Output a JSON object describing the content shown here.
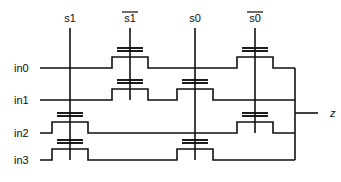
{
  "diagram": {
    "type": "transistor-level schematic",
    "ink_color": "#111111",
    "background_color": "#ffffff"
  },
  "control_signals": [
    {
      "id": "s1",
      "label": "s1",
      "overbar": false,
      "x": 70,
      "y_top": 28,
      "y_bottom": 160
    },
    {
      "id": "s1_bar",
      "label": "s1",
      "overbar": true,
      "x": 130,
      "y_top": 28,
      "y_bottom": 100
    },
    {
      "id": "s0",
      "label": "s0",
      "overbar": false,
      "x": 195,
      "y_top": 28,
      "y_bottom": 160
    },
    {
      "id": "s0_bar",
      "label": "s0",
      "overbar": true,
      "x": 255,
      "y_top": 28,
      "y_bottom": 133
    }
  ],
  "inputs": [
    {
      "id": "in0",
      "label": "in0",
      "y": 68
    },
    {
      "id": "in1",
      "label": "in1",
      "y": 100
    },
    {
      "id": "in2",
      "label": "in2",
      "y": 133
    },
    {
      "id": "in3",
      "label": "in3",
      "y": 160
    }
  ],
  "output": {
    "id": "z",
    "label": "z",
    "x": 330,
    "y": 113
  },
  "output_bus": {
    "x": 295,
    "y_top": 68,
    "y_bottom": 160
  },
  "transistors": [
    {
      "id": "t-in0-s1bar",
      "input": "in0",
      "gate": "s1_bar",
      "x": 130,
      "row_y": 68
    },
    {
      "id": "t-in0-s0bar",
      "input": "in0",
      "gate": "s0_bar",
      "x": 255,
      "row_y": 68
    },
    {
      "id": "t-in1-s1bar",
      "input": "in1",
      "gate": "s1_bar",
      "x": 130,
      "row_y": 100
    },
    {
      "id": "t-in1-s0",
      "input": "in1",
      "gate": "s0",
      "x": 195,
      "row_y": 100
    },
    {
      "id": "t-in2-s1",
      "input": "in2",
      "gate": "s1",
      "x": 70,
      "row_y": 133
    },
    {
      "id": "t-in2-s0bar",
      "input": "in2",
      "gate": "s0_bar",
      "x": 255,
      "row_y": 133
    },
    {
      "id": "t-in3-s1",
      "input": "in3",
      "gate": "s1",
      "x": 70,
      "row_y": 160
    },
    {
      "id": "t-in3-s0",
      "input": "in3",
      "gate": "s0",
      "x": 195,
      "row_y": 160
    }
  ],
  "geometry": {
    "rail_x_start": 40,
    "label_x": 14,
    "bump_half_width": 18,
    "bump_height": 11,
    "gate_bar_half_width": 13,
    "gate_bar_gap": 3,
    "gate_bar_offset": 6
  }
}
